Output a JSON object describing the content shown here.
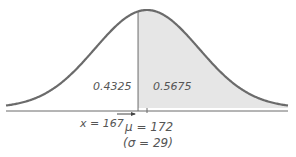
{
  "chart_data": {
    "type": "area",
    "title": "",
    "distribution": "normal",
    "mean": 172,
    "sd": 29,
    "x_value": 167,
    "areas": [
      {
        "region": "left of x",
        "value": 0.4325,
        "shaded": false
      },
      {
        "region": "right of x",
        "value": 0.5675,
        "shaded": true
      }
    ],
    "annotations": [
      "x = 167",
      "μ = 172",
      "(σ = 29)"
    ]
  },
  "labels": {
    "left_area": "0.4325",
    "right_area": "0.5675",
    "x_label": "x = 167",
    "mu_label": "μ = 172",
    "sigma_label": "(σ = 29)"
  },
  "colors": {
    "curve": "#6b6b6b",
    "shade": "#e6e6e6",
    "axis": "#6b6b6b"
  }
}
